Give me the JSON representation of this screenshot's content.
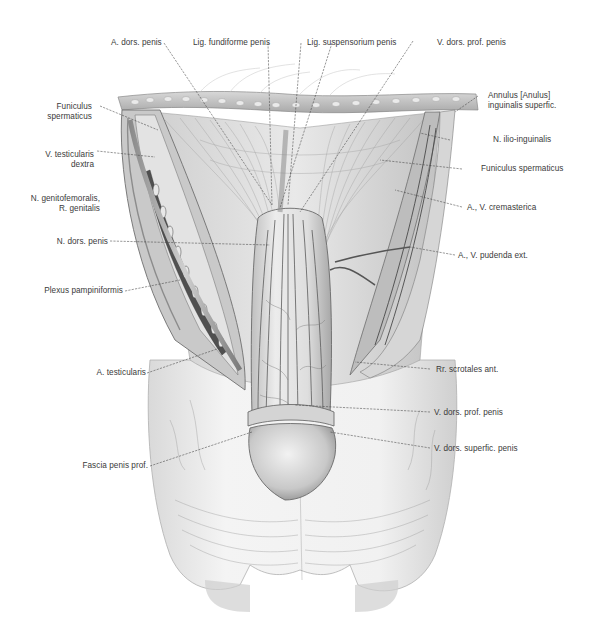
{
  "figure": {
    "colors": {
      "background": "#ffffff",
      "label_text": "#3a3a3a",
      "leader_line": "#444444",
      "tissue_light": "#e6e6e6",
      "tissue_mid": "#bdbdbd",
      "tissue_dark": "#6e6e6e",
      "vessel": "#555555"
    }
  },
  "labels": {
    "top": [
      {
        "id": "a-dors-penis",
        "text": "A. dors. penis"
      },
      {
        "id": "lig-fundiforme-penis",
        "text": "Lig. fundiforme penis"
      },
      {
        "id": "lig-suspensorium-penis",
        "text": "Lig. suspensorium penis"
      },
      {
        "id": "v-dors-prof-penis-top",
        "text": "V. dors. prof. penis"
      }
    ],
    "left": [
      {
        "id": "funiculus-spermaticus-left",
        "lines": [
          "Funiculus",
          "spermaticus"
        ]
      },
      {
        "id": "v-testicularis-dextra",
        "lines": [
          "V. testicularis",
          "dextra"
        ]
      },
      {
        "id": "n-genitofemoralis",
        "lines": [
          "N. genitofemoralis,",
          "R. genitalis"
        ]
      },
      {
        "id": "n-dors-penis",
        "text": "N. dors. penis"
      },
      {
        "id": "plexus-pampiniformis",
        "text": "Plexus pampiniformis"
      },
      {
        "id": "a-testicularis",
        "text": "A. testicularis"
      },
      {
        "id": "fascia-penis-prof",
        "text": "Fascia penis prof."
      }
    ],
    "right": [
      {
        "id": "annulus-inguinalis",
        "lines": [
          "Annulus [Anulus]",
          "inguinalis superfic."
        ]
      },
      {
        "id": "n-ilio-inguinalis",
        "text": "N. ilio-inguinalis"
      },
      {
        "id": "funiculus-spermaticus-right",
        "text": "Funiculus spermaticus"
      },
      {
        "id": "a-v-cremasterica",
        "text": "A., V. cremasterica"
      },
      {
        "id": "a-v-pudenda-ext",
        "text": "A., V. pudenda ext."
      },
      {
        "id": "rr-scrotales-ant",
        "text": "Rr. scrotales ant."
      },
      {
        "id": "v-dors-prof-penis-right",
        "text": "V. dors. prof. penis"
      },
      {
        "id": "v-dors-superfic-penis",
        "text": "V. dors. superfic. penis"
      }
    ]
  }
}
